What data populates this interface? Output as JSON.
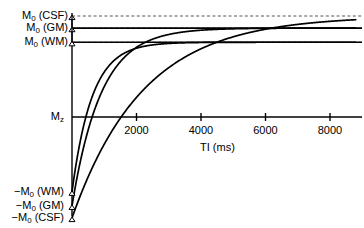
{
  "chart_data": {
    "type": "line",
    "title": "",
    "xlabel": "TI (ms)",
    "ylabel": "",
    "xlim": [
      0,
      8800
    ],
    "ylim": [
      -1.12,
      1.06
    ],
    "grid": false,
    "legend_position": "none",
    "x_ticks": [
      2000,
      4000,
      6000,
      8000
    ],
    "x_tick_labels": [
      "2000",
      "4000",
      "6000",
      "8000"
    ],
    "y_annotations": [
      {
        "name": "M0_CSF",
        "label": "M",
        "sub": "0",
        "suffix": " (CSF)",
        "value": 1.0
      },
      {
        "name": "M0_GM",
        "label": "M",
        "sub": "0",
        "suffix": " (GM)",
        "value": 0.88
      },
      {
        "name": "M0_WM",
        "label": "M",
        "sub": "0",
        "suffix": " (WM)",
        "value": 0.74
      },
      {
        "name": "Mz",
        "label": "M",
        "sub": "z",
        "suffix": "",
        "value": 0.0
      },
      {
        "name": "negM0_WM",
        "label": "−M",
        "sub": "0",
        "suffix": " (WM)",
        "value": -0.74
      },
      {
        "name": "negM0_GM",
        "label": "−M",
        "sub": "0",
        "suffix": " (GM)",
        "value": -0.88
      },
      {
        "name": "negM0_CSF",
        "label": "−M",
        "sub": "0",
        "suffix": " (CSF)",
        "value": -1.0
      }
    ],
    "series": [
      {
        "name": "WM",
        "m0": 0.74,
        "t1": 620,
        "null_ti": 430,
        "comment": "white matter inversion recovery"
      },
      {
        "name": "GM",
        "m0": 0.88,
        "t1": 900,
        "null_ti": 624,
        "comment": "gray matter inversion recovery"
      },
      {
        "name": "CSF",
        "m0": 1.0,
        "t1": 2200,
        "null_ti": 1525,
        "comment": "cerebrospinal fluid inversion recovery"
      }
    ],
    "equation": "Mz(TI) = M0 * (1 - 2*exp(-TI/T1))",
    "dashed_guides": [
      1.0,
      0.88,
      0.74
    ],
    "axis_color": "#000000",
    "curve_color": "#000000",
    "dash_color": "#555555"
  }
}
